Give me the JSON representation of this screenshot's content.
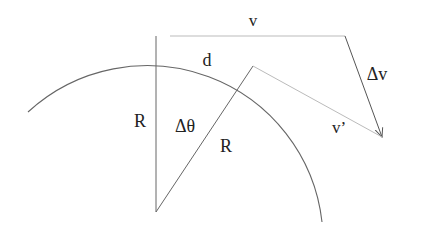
{
  "diagram": {
    "type": "circular-motion-velocity-change",
    "labels": {
      "v": "v",
      "v_prime": "v’",
      "delta_v": "Δv",
      "d": "d",
      "R_left": "R",
      "R_right": "R",
      "delta_theta": "Δθ"
    },
    "colors": {
      "line": "#555555",
      "light_line": "#aaaaaa",
      "text": "#222222"
    }
  }
}
